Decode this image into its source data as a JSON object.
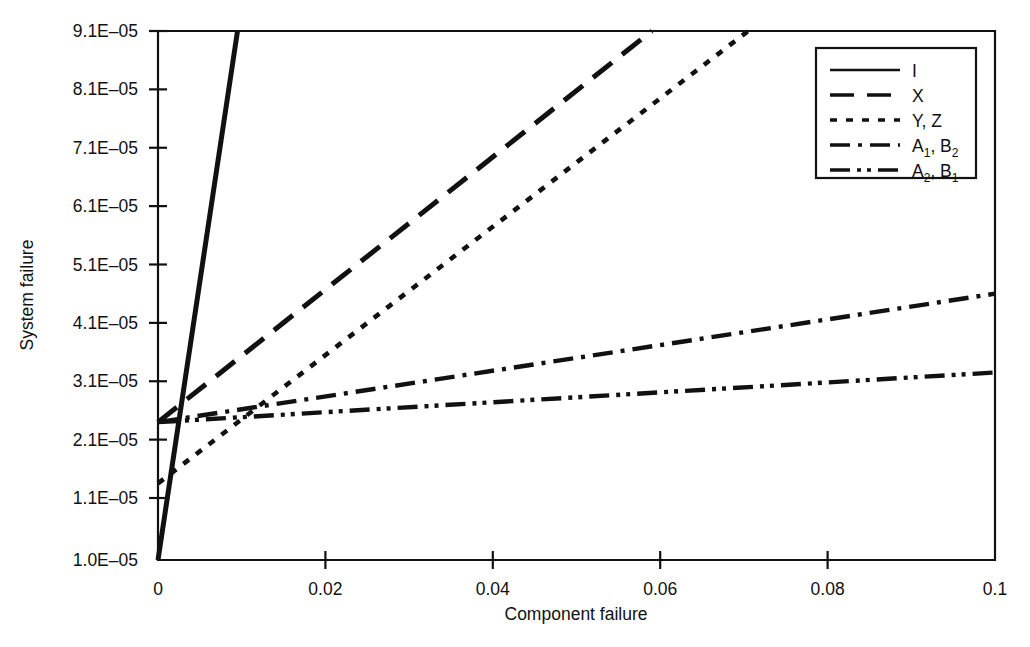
{
  "chart_data": {
    "type": "line",
    "title": "",
    "xlabel": "Component failure",
    "ylabel": "System failure",
    "xlim": [
      0,
      0.1
    ],
    "ylim": [
      1e-05,
      9.1e-05
    ],
    "grid": false,
    "legend_position": "top-right",
    "xticks": [
      0,
      0.02,
      0.04,
      0.06,
      0.08,
      0.1
    ],
    "xtick_labels": [
      "0",
      "0.02",
      "0.04",
      "0.06",
      "0.08",
      "0.1"
    ],
    "yticks": [
      1e-05,
      1.1e-05,
      2.1e-05,
      3.1e-05,
      4.1e-05,
      5.1e-05,
      6.1e-05,
      7.1e-05,
      8.1e-05,
      9.1e-05
    ],
    "ytick_labels": [
      "1.0E-05",
      "1.1E-05",
      "2.1E-05",
      "3.1E-05",
      "4.1E-05",
      "5.1E-05",
      "6.1E-05",
      "7.1E-05",
      "8.1E-05",
      "9.1E-05"
    ],
    "series": [
      {
        "name": "I",
        "legend_label": "I",
        "style": "solid",
        "x": [
          0,
          0.0095
        ],
        "y": [
          1e-05,
          9.1e-05
        ]
      },
      {
        "name": "X",
        "legend_label": "X",
        "style": "dashed",
        "x": [
          0,
          0.059
        ],
        "y": [
          2.4e-05,
          9.1e-05
        ]
      },
      {
        "name": "Y, Z",
        "legend_label": "Y, Z",
        "style": "dotted",
        "x": [
          0,
          0.0705
        ],
        "y": [
          1.35e-05,
          9.1e-05
        ]
      },
      {
        "name": "A1, B2",
        "legend_label_base": "A",
        "legend_label_sub1": "1",
        "legend_label_mid": ", B",
        "legend_label_sub2": "2",
        "style": "dashdot",
        "x": [
          0,
          0.1
        ],
        "y": [
          2.4e-05,
          4.6e-05
        ]
      },
      {
        "name": "A2, B1",
        "legend_label_base": "A",
        "legend_label_sub1": "2",
        "legend_label_mid": ", B",
        "legend_label_sub2": "1",
        "style": "dashdotdot",
        "x": [
          0,
          0.1
        ],
        "y": [
          2.4e-05,
          3.25e-05
        ]
      }
    ]
  },
  "axes": {
    "x_title": "Component failure",
    "y_title": "System failure",
    "x_tick_labels": [
      "0",
      "0.02",
      "0.04",
      "0.06",
      "0.08",
      "0.1"
    ],
    "y_tick_labels": [
      "9.1E–05",
      "8.1E–05",
      "7.1E–05",
      "6.1E–05",
      "5.1E–05",
      "4.1E–05",
      "3.1E–05",
      "2.1E–05",
      "1.1E–05",
      "1.0E–05"
    ]
  },
  "legend": {
    "entries": [
      {
        "label": "I",
        "sub1": "",
        "mid": "",
        "sub2": "",
        "style": "solid"
      },
      {
        "label": "X",
        "sub1": "",
        "mid": "",
        "sub2": "",
        "style": "dashed"
      },
      {
        "label": "Y, Z",
        "sub1": "",
        "mid": "",
        "sub2": "",
        "style": "dotted"
      },
      {
        "label": "A",
        "sub1": "1",
        "mid": ", B",
        "sub2": "2",
        "style": "dashdot"
      },
      {
        "label": "A",
        "sub1": "2",
        "mid": ", B",
        "sub2": "1",
        "style": "dashdotdot"
      }
    ]
  },
  "colors": {
    "ink": "#111111",
    "background": "#ffffff"
  }
}
